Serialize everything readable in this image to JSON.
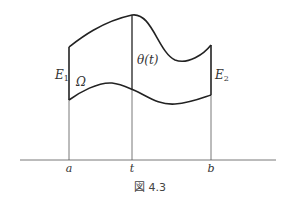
{
  "figure": {
    "caption": "図 4.3",
    "labels": {
      "E1": "E",
      "E1_sub": "1",
      "E2": "E",
      "E2_sub": "2",
      "omega": "Ω",
      "theta": "θ(t)"
    },
    "axis_ticks": [
      "a",
      "t",
      "b"
    ],
    "colors": {
      "stroke": "#222222",
      "thin_line": "#555555",
      "text": "#333333",
      "background": "#ffffff"
    }
  }
}
